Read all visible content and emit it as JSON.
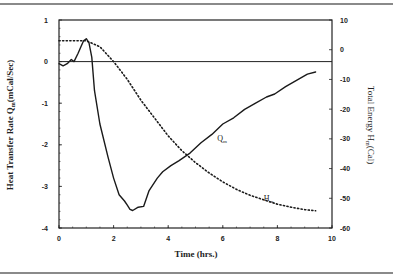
{
  "chart_data": {
    "type": "line",
    "title": "",
    "xlabel": "Time (hrs.)",
    "ylabel": "Heat Transfer Rate Q_m(mCal/Sec)",
    "y2label": "Total Energy H_m(Cal)",
    "xlim": [
      0,
      10
    ],
    "ylim": [
      -4,
      1
    ],
    "y2lim": [
      -60,
      10
    ],
    "x_ticks": [
      "0",
      "2",
      "4",
      "6",
      "8",
      "10"
    ],
    "y_ticks": [
      "1",
      "0",
      "-1",
      "-2",
      "-3",
      "-4"
    ],
    "y2_ticks": [
      "10",
      "0",
      "-10",
      "-20",
      "-30",
      "-40",
      "-50",
      "-60"
    ],
    "grid": false,
    "reference_line": {
      "axis": "y",
      "value": 0
    },
    "series": [
      {
        "name": "Q_m",
        "axis": "left",
        "style": "solid",
        "label_position": {
          "x": 5.8,
          "y": -1.9
        },
        "x": [
          0,
          0.15,
          0.3,
          0.45,
          0.55,
          0.7,
          0.8,
          0.9,
          1.0,
          1.1,
          1.2,
          1.3,
          1.5,
          1.8,
          2.0,
          2.2,
          2.4,
          2.5,
          2.6,
          2.7,
          2.9,
          3.1,
          3.3,
          3.6,
          3.8,
          4.1,
          4.4,
          4.8,
          5.2,
          5.6,
          6.0,
          6.4,
          6.8,
          7.2,
          7.6,
          7.9,
          8.3,
          8.7,
          9.1,
          9.4
        ],
        "values": [
          -0.05,
          -0.1,
          -0.05,
          0.05,
          0.0,
          0.2,
          0.35,
          0.5,
          0.55,
          0.45,
          0.1,
          -0.7,
          -1.5,
          -2.3,
          -2.8,
          -3.2,
          -3.35,
          -3.45,
          -3.55,
          -3.58,
          -3.5,
          -3.48,
          -3.1,
          -2.8,
          -2.65,
          -2.5,
          -2.38,
          -2.2,
          -1.95,
          -1.75,
          -1.5,
          -1.35,
          -1.15,
          -1.0,
          -0.85,
          -0.78,
          -0.6,
          -0.45,
          -0.3,
          -0.25
        ]
      },
      {
        "name": "H_m",
        "axis": "right",
        "style": "dotted",
        "label_position": {
          "x": 7.5,
          "y": -51
        },
        "x": [
          0,
          0.5,
          1.0,
          1.5,
          2.0,
          2.5,
          3.0,
          3.5,
          4.0,
          4.5,
          5.0,
          5.5,
          6.0,
          6.5,
          7.0,
          7.5,
          8.0,
          8.5,
          9.0,
          9.4
        ],
        "values": [
          3,
          3,
          3,
          1,
          -4,
          -10,
          -17,
          -23,
          -29,
          -34,
          -38,
          -41.5,
          -44.5,
          -47,
          -49,
          -50.5,
          -52,
          -53,
          -53.8,
          -54.2
        ]
      }
    ]
  },
  "labels": {
    "x_axis_title": "Time  (hrs.)",
    "y_axis_title_left": "Heat Transfer Rate  Q",
    "y_axis_title_left_sub": "m",
    "y_axis_title_left_unit": "(mCal/Sec)",
    "y_axis_title_right": "Total Energy  H",
    "y_axis_title_right_sub": "m",
    "y_axis_title_right_unit": "(Cal)",
    "series_label_q": "Q",
    "series_label_q_sub": "m",
    "series_label_h": "H",
    "series_label_h_sub": "m"
  }
}
